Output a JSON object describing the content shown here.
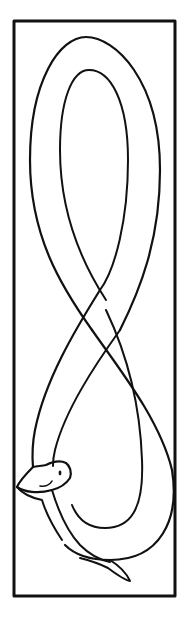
{
  "image": {
    "description": "Line drawing of a serpent shaped into a figure eight inside a rectangular frame",
    "subject": "serpent-figure-eight",
    "colors": {
      "ink": "#111111",
      "background": "#ffffff"
    }
  }
}
